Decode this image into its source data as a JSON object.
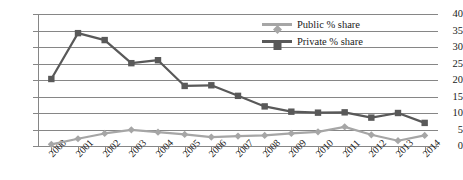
{
  "chart_data": {
    "type": "line",
    "title": "",
    "xlabel": "",
    "ylabel": "",
    "x": [
      "2000",
      "2001",
      "2002",
      "2003",
      "2004",
      "2005",
      "2006",
      "2007",
      "2008",
      "2009",
      "2010",
      "2011",
      "2012",
      "2013",
      "2014"
    ],
    "categories": [
      "2000",
      "2001",
      "2002",
      "2003",
      "2004",
      "2005",
      "2006",
      "2007",
      "2008",
      "2009",
      "2010",
      "2011",
      "2012",
      "2013",
      "2014"
    ],
    "ylim": [
      0,
      40
    ],
    "yticks": [
      0,
      5,
      10,
      15,
      20,
      25,
      30,
      35,
      40
    ],
    "grid": true,
    "legend_position": "top-right",
    "series": [
      {
        "name": "Public % share",
        "color": "#a6a6a6",
        "marker": "diamond",
        "values": [
          0.5,
          2.2,
          3.8,
          4.9,
          4.2,
          3.5,
          2.7,
          3.0,
          3.2,
          3.8,
          4.3,
          5.8,
          3.4,
          1.6,
          3.2
        ]
      },
      {
        "name": "Private % share",
        "color": "#595959",
        "marker": "square",
        "values": [
          20.3,
          34.2,
          32.1,
          25.1,
          26.0,
          18.2,
          18.4,
          15.2,
          12.0,
          10.4,
          10.1,
          10.2,
          8.6,
          10.0,
          7.0
        ]
      }
    ]
  },
  "legend": {
    "items": [
      {
        "label": "Public % share"
      },
      {
        "label": "Private % share"
      }
    ]
  }
}
